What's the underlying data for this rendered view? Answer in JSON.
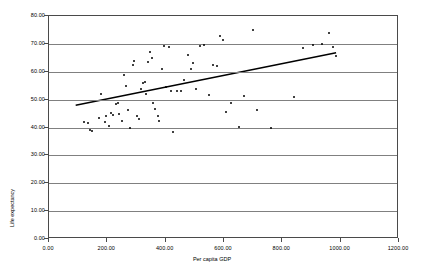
{
  "chart_data": {
    "type": "scatter",
    "title": "",
    "xlabel": "Per capita GDP",
    "ylabel": "Life expectancy",
    "xlim": [
      0,
      1200
    ],
    "ylim": [
      0,
      80
    ],
    "grid": true,
    "legend": false,
    "xticks": [
      "0.00",
      "200.00",
      "400.00",
      "600.00",
      "800.00",
      "1000.00",
      "1200.00"
    ],
    "yticks": [
      "0.00",
      "10.00",
      "20.00",
      "30.00",
      "40.00",
      "50.00",
      "60.00",
      "70.00",
      "80.00"
    ],
    "xtick_values": [
      0,
      200,
      400,
      600,
      800,
      1000,
      1200
    ],
    "ytick_values": [
      0,
      10,
      20,
      30,
      40,
      50,
      60,
      70,
      80
    ],
    "series": [
      {
        "name": "Countries",
        "marker": "dot",
        "color": "#000000",
        "points": [
          [
            120,
            42.0
          ],
          [
            133,
            41.5
          ],
          [
            140,
            39.0
          ],
          [
            149,
            38.7
          ],
          [
            170,
            43.3
          ],
          [
            178,
            51.9
          ],
          [
            192,
            42.0
          ],
          [
            196,
            44.0
          ],
          [
            205,
            40.5
          ],
          [
            213,
            45.2
          ],
          [
            219,
            44.5
          ],
          [
            228,
            48.5
          ],
          [
            235,
            48.8
          ],
          [
            241,
            45.0
          ],
          [
            250,
            42.5
          ],
          [
            258,
            58.8
          ],
          [
            265,
            54.8
          ],
          [
            272,
            46.3
          ],
          [
            278,
            39.9
          ],
          [
            287,
            62.3
          ],
          [
            292,
            63.8
          ],
          [
            300,
            44.2
          ],
          [
            307,
            43.1
          ],
          [
            315,
            53.9
          ],
          [
            322,
            55.9
          ],
          [
            328,
            56.2
          ],
          [
            333,
            52.0
          ],
          [
            340,
            63.4
          ],
          [
            347,
            67.1
          ],
          [
            352,
            65.0
          ],
          [
            358,
            48.9
          ],
          [
            365,
            46.5
          ],
          [
            372,
            44.3
          ],
          [
            378,
            42.3
          ],
          [
            386,
            61.0
          ],
          [
            394,
            69.2
          ],
          [
            402,
            54.5
          ],
          [
            410,
            68.8
          ],
          [
            418,
            53.2
          ],
          [
            425,
            38.5
          ],
          [
            440,
            53.0
          ],
          [
            452,
            53.2
          ],
          [
            462,
            57.0
          ],
          [
            475,
            66.1
          ],
          [
            486,
            61.0
          ],
          [
            495,
            63.0
          ],
          [
            505,
            53.9
          ],
          [
            516,
            69.2
          ],
          [
            530,
            69.5
          ],
          [
            548,
            51.8
          ],
          [
            562,
            62.6
          ],
          [
            575,
            62.0
          ],
          [
            585,
            72.8
          ],
          [
            595,
            71.3
          ],
          [
            608,
            45.7
          ],
          [
            625,
            48.7
          ],
          [
            650,
            40.1
          ],
          [
            668,
            51.2
          ],
          [
            700,
            75.0
          ],
          [
            712,
            46.2
          ],
          [
            760,
            39.8
          ],
          [
            840,
            51.0
          ],
          [
            870,
            68.5
          ],
          [
            905,
            69.5
          ],
          [
            935,
            70.1
          ],
          [
            960,
            73.8
          ],
          [
            975,
            69.0
          ],
          [
            985,
            65.8
          ]
        ]
      }
    ],
    "trendline": {
      "name": "Linear trend",
      "color": "#000000",
      "x_start": 92,
      "y_start": 47.7,
      "x_end": 990,
      "y_end": 66.7
    }
  }
}
